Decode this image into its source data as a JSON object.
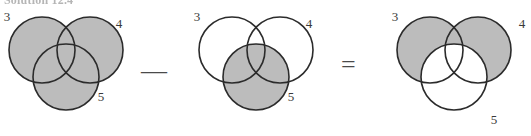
{
  "header": {
    "text": "Solution 12.4",
    "clipped": true
  },
  "operators": {
    "minus": "—",
    "equals": "=",
    "minus_name": "minus-sign",
    "equals_name": "equals-sign"
  },
  "style": {
    "shade_color": "#bcbcbc",
    "stroke_color": "#2b2b2b",
    "background": "#ffffff",
    "label_color": "#3a3a3a"
  },
  "diagrams": [
    {
      "id": "venn-left",
      "name": "venn-diagram-union-3-4-5",
      "labels": {
        "left": "3",
        "right": "4",
        "bottom": "5"
      },
      "shaded_regions": [
        "circle-3",
        "circle-4",
        "circle-5"
      ],
      "description": "all three circles shaded"
    },
    {
      "id": "venn-middle",
      "name": "venn-diagram-circle-5",
      "labels": {
        "left": "3",
        "right": "4",
        "bottom": "5"
      },
      "shaded_regions": [
        "circle-5"
      ],
      "description": "only bottom circle shaded"
    },
    {
      "id": "venn-right",
      "name": "venn-diagram-union-3-4-minus-5",
      "labels": {
        "left": "3",
        "right": "4",
        "bottom": "5"
      },
      "shaded_regions": [
        "circle-3-minus-5",
        "circle-4-minus-5"
      ],
      "description": "circles 3 and 4 shaded excluding circle 5"
    }
  ],
  "geometry": {
    "radius": 33,
    "left_circle": {
      "cx": 42,
      "cy": 50
    },
    "right_circle": {
      "cx": 90,
      "cy": 50
    },
    "bottom_circle": {
      "cx": 66,
      "cy": 77
    },
    "label_left": {
      "x": 7,
      "y": 21
    },
    "label_right": {
      "x": 119,
      "y": 28
    },
    "label_bottom": {
      "x": 101,
      "y": 101
    },
    "offsets": {
      "left": 0,
      "middle": 190,
      "right": 388
    }
  }
}
